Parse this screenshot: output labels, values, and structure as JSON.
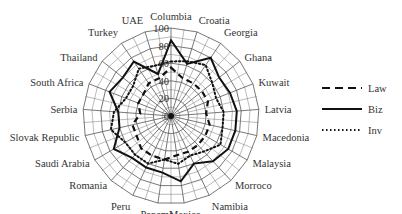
{
  "chart_data": {
    "type": "radar",
    "title": "",
    "axis_range": [
      0,
      100
    ],
    "radial_ticks": [
      0,
      20,
      40,
      60,
      80,
      100
    ],
    "grid": true,
    "legend_position": "right",
    "categories": [
      "Columbia",
      "Croatia",
      "Georgia",
      "Ghana",
      "Kuwait",
      "Latvia",
      "Macedonia",
      "Malaysia",
      "Morroco",
      "Namibia",
      "Mexico",
      "Panama",
      "Peru",
      "Romania",
      "Saudi Arabia",
      "Slovak Republic",
      "Serbia",
      "South Africa",
      "Thailand",
      "Turkey",
      "UAE"
    ],
    "series": [
      {
        "name": "Law",
        "style": "dashed",
        "values": [
          55,
          45,
          45,
          45,
          45,
          40,
          45,
          45,
          45,
          45,
          45,
          50,
          50,
          50,
          45,
          45,
          35,
          40,
          40,
          45,
          45
        ]
      },
      {
        "name": "Biz",
        "style": "solid",
        "values": [
          86,
          62,
          80,
          70,
          72,
          75,
          75,
          75,
          70,
          60,
          75,
          65,
          65,
          65,
          75,
          60,
          60,
          75,
          70,
          75,
          50
        ]
      },
      {
        "name": "Inv",
        "style": "dotted",
        "values": [
          62,
          65,
          70,
          60,
          55,
          60,
          60,
          65,
          55,
          50,
          55,
          50,
          60,
          60,
          60,
          70,
          65,
          55,
          55,
          65,
          60
        ]
      }
    ]
  },
  "legend": {
    "items": [
      {
        "label": "Law",
        "style": "dashed"
      },
      {
        "label": "Biz",
        "style": "solid"
      },
      {
        "label": "Inv",
        "style": "dotted"
      }
    ]
  }
}
